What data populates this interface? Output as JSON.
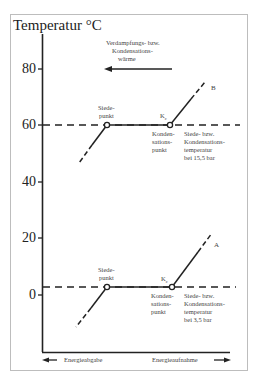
{
  "diagram": {
    "y_axis_title": "Temperatur °C",
    "y_ticks": [
      {
        "label": "80",
        "value": 80
      },
      {
        "label": "60",
        "value": 60
      },
      {
        "label": "40",
        "value": 40
      },
      {
        "label": "20",
        "value": 20
      },
      {
        "label": "0",
        "value": 0
      }
    ],
    "annotation_heat": {
      "line1": "Verdampfungs- bzw.",
      "line2": "Kondensations-",
      "line3": "wärme"
    },
    "curve_B": {
      "label": "B",
      "level_temperature": 60,
      "boiling_point": {
        "line1": "Siede-",
        "line2": "punkt"
      },
      "condensation_marker": "K",
      "condensation_marker_sub": "c",
      "condensation_point": {
        "line1": "Konden-",
        "line2": "sations-",
        "line3": "punkt"
      },
      "temperature_note": {
        "line1": "Siede- bzw.",
        "line2": "Kondensations-",
        "line3": "temperatur",
        "line4": "bei 15,5 bar"
      }
    },
    "curve_A": {
      "label": "A",
      "level_temperature": 3,
      "boiling_point": {
        "line1": "Siede-",
        "line2": "punkt"
      },
      "condensation_marker": "K",
      "condensation_marker_sub": "c",
      "condensation_point": {
        "line1": "Konden-",
        "line2": "sations-",
        "line3": "punkt"
      },
      "temperature_note": {
        "line1": "Siede- bzw.",
        "line2": "Kondensations-",
        "line3": "temperatur",
        "line4": "bei 3,5 bar"
      }
    },
    "x_axis": {
      "left_label": "Energieabgabe",
      "right_label": "Energieaufnahme"
    }
  }
}
